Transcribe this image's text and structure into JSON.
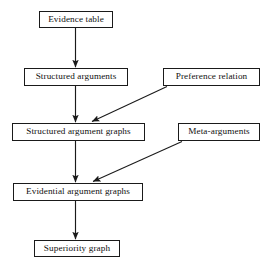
{
  "diagram": {
    "type": "flowchart",
    "title": "",
    "background_color": "#ffffff",
    "line_color": "#1a1a1a",
    "text_color": "#111111",
    "nodes": [
      {
        "id": "evidence-table",
        "label": "Evidence table",
        "x": 39,
        "y": 11,
        "w": 74,
        "h": 17
      },
      {
        "id": "structured-arguments",
        "label": "Structured arguments",
        "x": 24,
        "y": 68,
        "w": 104,
        "h": 18
      },
      {
        "id": "preference-relation",
        "label": "Preference relation",
        "x": 163,
        "y": 68,
        "w": 97,
        "h": 18
      },
      {
        "id": "structured-argument-graphs",
        "label": "Structured argument graphs",
        "x": 12,
        "y": 123,
        "w": 133,
        "h": 18
      },
      {
        "id": "meta-arguments",
        "label": "Meta-arguments",
        "x": 178,
        "y": 123,
        "w": 82,
        "h": 18
      },
      {
        "id": "evidential-argument-graphs",
        "label": "Evidential argument graphs",
        "x": 13,
        "y": 183,
        "w": 130,
        "h": 18
      },
      {
        "id": "superiority-graph",
        "label": "Superiority graph",
        "x": 34,
        "y": 240,
        "w": 86,
        "h": 17
      }
    ],
    "edges": [
      {
        "id": "edge-evidence-to-structured",
        "from": "evidence-table",
        "to": "structured-arguments",
        "kind": "vertical-arrow"
      },
      {
        "id": "edge-structured-to-graphs",
        "from": "structured-arguments",
        "to": "structured-argument-graphs",
        "kind": "vertical-arrow"
      },
      {
        "id": "edge-preference-to-graphs",
        "from": "preference-relation",
        "to": "structured-argument-graphs",
        "kind": "diagonal-arrow"
      },
      {
        "id": "edge-graphs-to-evidential",
        "from": "structured-argument-graphs",
        "to": "evidential-argument-graphs",
        "kind": "vertical-arrow"
      },
      {
        "id": "edge-meta-to-evidential",
        "from": "meta-arguments",
        "to": "evidential-argument-graphs",
        "kind": "diagonal-arrow"
      },
      {
        "id": "edge-evidential-to-superiority",
        "from": "evidential-argument-graphs",
        "to": "superiority-graph",
        "kind": "vertical-arrow"
      }
    ]
  }
}
